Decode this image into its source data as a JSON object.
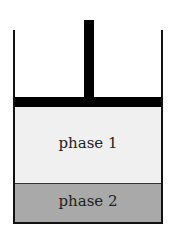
{
  "diagram": {
    "type": "piston-cylinder",
    "phases": [
      {
        "label": "phase 1",
        "color": "#f0f0f0"
      },
      {
        "label": "phase 2",
        "color": "#a9a9a9"
      }
    ],
    "piston_color": "#000000",
    "wall_color": "#111111"
  }
}
